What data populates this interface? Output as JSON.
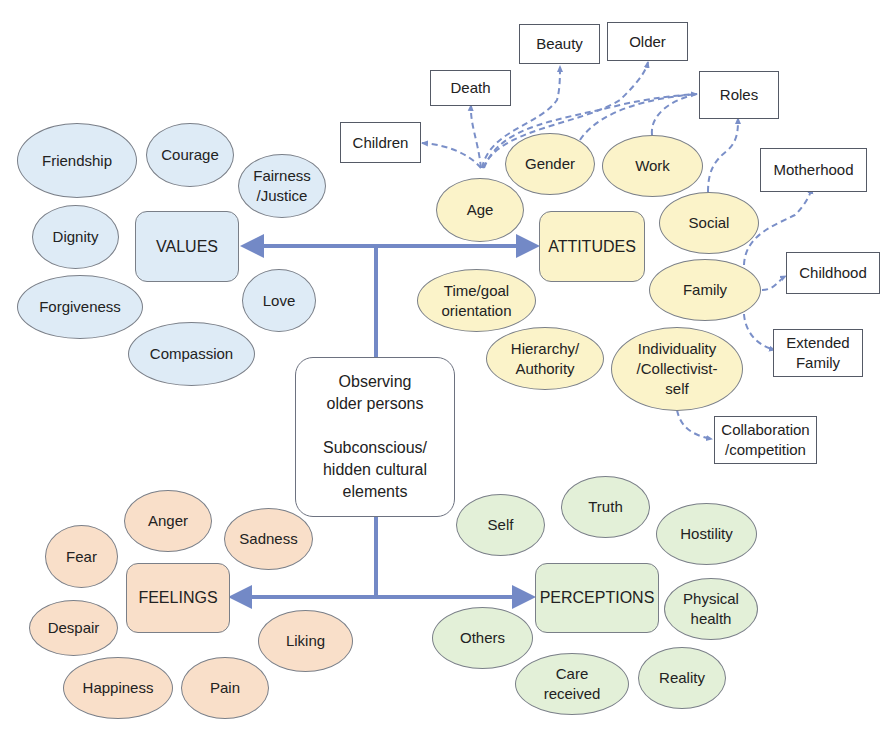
{
  "center": {
    "text": "Observing\nolder persons\n\nSubconscious/\nhidden cultural\nelements"
  },
  "colors": {
    "arrow": "#7389c6",
    "values": "#deebf6",
    "attitudes": "#fbf3c9",
    "feelings": "#f9dfc9",
    "perceptions": "#e3f0d8"
  },
  "values": {
    "hub": "VALUES",
    "items": [
      "Friendship",
      "Courage",
      "Fairness\n/Justice",
      "Dignity",
      "Love",
      "Forgiveness",
      "Compassion"
    ]
  },
  "attitudes": {
    "hub": "ATTITUDES",
    "items": [
      "Age",
      "Gender",
      "Work",
      "Social",
      "Family",
      "Time/goal\norientation",
      "Hierarchy/\nAuthority",
      "Individuality\n/Collectivist-\nself"
    ],
    "subtopics": [
      "Children",
      "Death",
      "Beauty",
      "Older",
      "Roles",
      "Motherhood",
      "Childhood",
      "Extended\nFamily",
      "Collaboration\n/competition"
    ]
  },
  "feelings": {
    "hub": "FEELINGS",
    "items": [
      "Anger",
      "Sadness",
      "Fear",
      "Despair",
      "Liking",
      "Happiness",
      "Pain"
    ]
  },
  "perceptions": {
    "hub": "PERCEPTIONS",
    "items": [
      "Self",
      "Truth",
      "Hostility",
      "Physical\nhealth",
      "Others",
      "Care\nreceived",
      "Reality"
    ]
  }
}
